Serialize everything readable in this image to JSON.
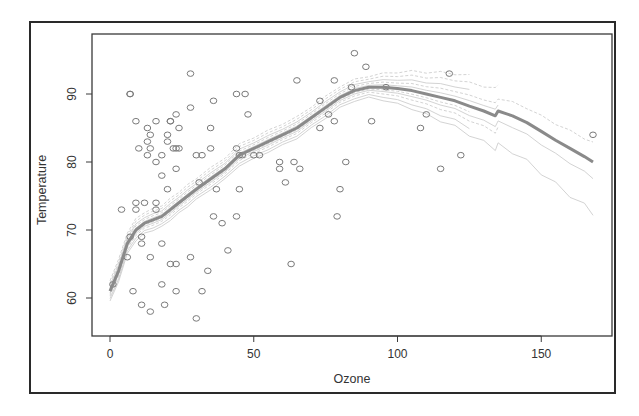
{
  "chart_data": {
    "type": "scatter",
    "title": "",
    "xlabel": "Ozone",
    "ylabel": "Temperature",
    "xlim": [
      -5,
      173
    ],
    "ylim": [
      54.5,
      98.5
    ],
    "xticks": [
      0,
      50,
      100,
      150
    ],
    "yticks": [
      60,
      70,
      80,
      90
    ],
    "grid": false,
    "legend": null,
    "point_style": "open-circle",
    "colors": {
      "points": "#7a7a7a",
      "smooth": "#8a8a8a",
      "bootstrap": "#c8c8c8",
      "frame": "#2a2a2a"
    },
    "points": {
      "x": [
        41,
        36,
        12,
        18,
        28,
        23,
        19,
        8,
        7,
        16,
        11,
        14,
        18,
        14,
        34,
        6,
        30,
        11,
        1,
        11,
        4,
        32,
        23,
        45,
        115,
        37,
        10,
        7,
        48,
        35,
        61,
        79,
        63,
        16,
        80,
        108,
        20,
        52,
        82,
        50,
        64,
        59,
        39,
        9,
        16,
        78,
        35,
        66,
        122,
        89,
        110,
        44,
        28,
        65,
        22,
        59,
        23,
        31,
        44,
        21,
        9,
        45,
        168,
        73,
        76,
        118,
        84,
        85,
        96,
        78,
        73,
        91,
        47,
        32,
        20,
        23,
        21,
        24,
        44,
        21,
        28,
        9,
        13,
        46,
        18,
        13,
        24,
        16,
        13,
        23,
        36,
        7,
        14,
        30,
        14,
        18,
        20
      ],
      "y": [
        67,
        72,
        74,
        62,
        66,
        65,
        59,
        61,
        69,
        74,
        69,
        66,
        68,
        58,
        64,
        66,
        57,
        68,
        62,
        59,
        73,
        61,
        61,
        81,
        79,
        76,
        82,
        90,
        87,
        82,
        77,
        72,
        65,
        73,
        76,
        85,
        83,
        81,
        80,
        81,
        80,
        79,
        71,
        74,
        80,
        86,
        85,
        79,
        81,
        94,
        87,
        90,
        93,
        92,
        82,
        80,
        79,
        77,
        72,
        65,
        73,
        76,
        84,
        85,
        87,
        93,
        91,
        96,
        91,
        92,
        89,
        86,
        90,
        81,
        84,
        82,
        86,
        85,
        82,
        86,
        88,
        86,
        83,
        81,
        81,
        81,
        82,
        86,
        85,
        87,
        89,
        90,
        84,
        81,
        82,
        78,
        76
      ]
    },
    "smooth_curve": {
      "x": [
        0,
        3,
        6,
        9,
        12,
        15,
        18,
        21,
        24,
        27,
        30,
        35,
        40,
        45,
        50,
        55,
        60,
        65,
        70,
        75,
        80,
        85,
        90,
        95,
        100,
        105,
        110,
        115,
        120,
        125,
        130,
        134,
        135,
        140,
        145,
        150,
        155,
        160,
        165,
        168
      ],
      "y": [
        61,
        64,
        68,
        70,
        71,
        71.5,
        72,
        73,
        74,
        75,
        76,
        77.5,
        79,
        81,
        82,
        83,
        84,
        85,
        86.5,
        88,
        89.5,
        90.5,
        91,
        91,
        90.8,
        90.5,
        90,
        89.5,
        89,
        88.2,
        87.5,
        86.8,
        87.5,
        86.8,
        85.8,
        84.5,
        83.2,
        82,
        80.8,
        80
      ]
    }
  }
}
